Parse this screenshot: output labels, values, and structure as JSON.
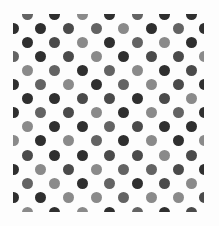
{
  "image": {
    "description": "Polka dot pattern tile with grey-scale dots on white",
    "background": "#fdfdfd",
    "dot_diameter": 11,
    "palette": {
      "d": "#2f2f2f",
      "m": "#4a4a4a",
      "n": "#636363",
      "l": "#8a8a8a"
    },
    "clip": {
      "left": 13,
      "top": 14,
      "right": 204,
      "bottom": 212
    },
    "row_y": [
      14,
      28,
      42,
      56,
      70,
      84,
      98,
      112,
      126,
      140,
      155,
      169,
      183,
      197,
      212
    ],
    "even_cols_x": [
      27,
      54,
      82,
      109,
      137,
      164,
      191
    ],
    "odd_cols_x": [
      13,
      40,
      68,
      96,
      123,
      151,
      178,
      204
    ],
    "rows": [
      "ndldndd",
      "ddmnldnd",
      "dmldnld",
      "ndmldmml",
      "lndnldm",
      "dnldnlmd",
      "ddmmdml",
      "dnmldlnd",
      "lddnmdd",
      "ldlndldl",
      "mddmmlm",
      "dlmlnnmd",
      "nldndml",
      "ddllnllm",
      "ldldndm"
    ]
  }
}
